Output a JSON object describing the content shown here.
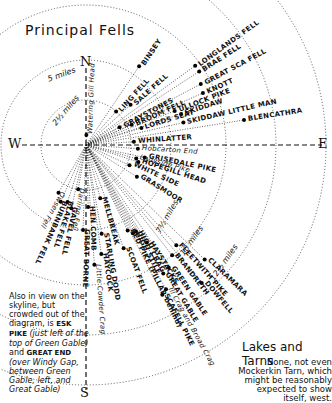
{
  "title": "Principal Fells",
  "compass": {
    "north": "N",
    "south": "S",
    "east": "E",
    "west": "W"
  },
  "distance_rings": [
    {
      "label": "2½ miles"
    },
    {
      "label": "5 miles"
    },
    {
      "label": "7½ miles"
    },
    {
      "label": "10 miles"
    },
    {
      "label": "12½ miles"
    }
  ],
  "fells": [
    {
      "name": "BINSEY",
      "angle": -56,
      "dist": 95
    },
    {
      "name": "LONGLANDS FELL",
      "angle": -36,
      "dist": 135
    },
    {
      "name": "BRAE FELL",
      "angle": -33,
      "dist": 135
    },
    {
      "name": "GREAT SCA FELL",
      "angle": -28,
      "dist": 130
    },
    {
      "name": "KNOTT",
      "angle": -24,
      "dist": 128
    },
    {
      "name": "LING FELL",
      "angle": -48,
      "dist": 45
    },
    {
      "name": "SALE FELL",
      "angle": -42,
      "dist": 60
    },
    {
      "name": "GRAYSTONES",
      "angle": -28,
      "dist": 38
    },
    {
      "name": "BROOM FELL",
      "angle": -24,
      "dist": 50
    },
    {
      "name": "LORDS SEAT",
      "angle": -17,
      "dist": 58
    },
    {
      "name": "ULLOCK PIKE",
      "angle": -21,
      "dist": 95
    },
    {
      "name": "SKIDDAW",
      "angle": -18,
      "dist": 100
    },
    {
      "name": "SKIDDAW LITTLE MAN",
      "angle": -13,
      "dist": 100
    },
    {
      "name": "BLENCATHRA",
      "angle": -9,
      "dist": 160
    },
    {
      "name": "WHINLATTER",
      "angle": -4,
      "dist": 48
    },
    {
      "name": "Hobcarton End",
      "angle": 4,
      "dist": 52,
      "lower": true
    },
    {
      "name": "GRISEDALE PIKE",
      "angle": 12,
      "dist": 60
    },
    {
      "name": "Ladyside Pike",
      "angle": 15,
      "dist": 52,
      "lower": true
    },
    {
      "name": "HOPEGILL HEAD",
      "angle": 18,
      "dist": 55
    },
    {
      "name": "WHITE SIDE",
      "angle": 25,
      "dist": 48
    },
    {
      "name": "GRASMOOR",
      "angle": 32,
      "dist": 60
    },
    {
      "name": "FLEETWITH PIKE",
      "angle": 48,
      "dist": 135
    },
    {
      "name": "CLARAMARA",
      "angle": 44,
      "dist": 165
    },
    {
      "name": "BRANDRETH",
      "angle": 52,
      "dist": 140
    },
    {
      "name": "DOWFELL",
      "angle": 50,
      "dist": 180
    },
    {
      "name": "GREEN GABLE",
      "angle": 56,
      "dist": 148
    },
    {
      "name": "GREAT GABLE",
      "angle": 59,
      "dist": 150
    },
    {
      "name": "Ill Crag and Broad Crag",
      "angle": 61,
      "dist": 165,
      "lower": true
    },
    {
      "name": "SCAFELL PIKE",
      "angle": 63,
      "dist": 168
    },
    {
      "name": "HAYSTACKS",
      "angle": 58,
      "dist": 115
    },
    {
      "name": "HIGH CRAG",
      "angle": 60,
      "dist": 100
    },
    {
      "name": "HIGH STILE",
      "angle": 62,
      "dist": 100
    },
    {
      "name": "RED PIKE (PILLAR behind)",
      "angle": 64,
      "dist": 95
    },
    {
      "name": "MELLBREAK",
      "angle": 75,
      "dist": 55
    },
    {
      "name": "STARLING DODD",
      "angle": 80,
      "dist": 90
    },
    {
      "name": "SCOAT FELL",
      "angle": 70,
      "dist": 110
    },
    {
      "name": "HAYCOCK",
      "angle": 82,
      "dist": 110
    },
    {
      "name": "Little Cowder Crag",
      "angle": 86,
      "dist": 120,
      "lower": true
    },
    {
      "name": "HEN COMB",
      "angle": 88,
      "dist": 62
    },
    {
      "name": "GREAT BORNE",
      "angle": 92,
      "dist": 85
    },
    {
      "name": "Darling Fell",
      "angle": 100,
      "dist": 45,
      "lower": true
    },
    {
      "name": "GAVEL FELL",
      "angle": 103,
      "dist": 65
    },
    {
      "name": "BLAKE FELL",
      "angle": 108,
      "dist": 60
    },
    {
      "name": "BURNBANK FELL",
      "angle": 114,
      "dist": 62
    },
    {
      "name": "Owsen Fell",
      "angle": 120,
      "dist": 55,
      "lower": true
    },
    {
      "name": "Watering Gill Head",
      "angle": -88,
      "dist": 10,
      "lower": true
    }
  ],
  "note": {
    "line1": "Also in view on the skyline, but crowded out of the diagram, is",
    "esk": "ESK PIKE",
    "line2": "(just left of the top of Green Gable)",
    "and": "and",
    "great_end": "GREAT END",
    "line3": "(over Windy Gap, between Green Gable, left, and Great Gable)"
  },
  "lakes": {
    "title": "Lakes and Tarns",
    "text": "None, not even Mockerkin Tarn, which might be reasonably expected to show itself, west."
  }
}
